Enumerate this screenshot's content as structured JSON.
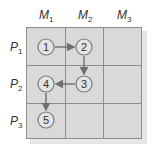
{
  "diagram": {
    "columns": [
      {
        "label": "M",
        "sub": "1"
      },
      {
        "label": "M",
        "sub": "2"
      },
      {
        "label": "M",
        "sub": "3"
      }
    ],
    "rows": [
      {
        "label": "P",
        "sub": "1"
      },
      {
        "label": "P",
        "sub": "2"
      },
      {
        "label": "P",
        "sub": "3"
      }
    ],
    "nodes": [
      {
        "id": "1",
        "row": 1,
        "col": 1
      },
      {
        "id": "2",
        "row": 1,
        "col": 2
      },
      {
        "id": "3",
        "row": 2,
        "col": 2
      },
      {
        "id": "4",
        "row": 2,
        "col": 1
      },
      {
        "id": "5",
        "row": 3,
        "col": 1
      }
    ],
    "edges": [
      {
        "from": "1",
        "to": "2"
      },
      {
        "from": "2",
        "to": "3"
      },
      {
        "from": "3",
        "to": "4"
      },
      {
        "from": "4",
        "to": "5"
      }
    ],
    "colors": {
      "cell_fill": "#d9d9d9",
      "grid_line": "#8c8c8c",
      "node_fill": "#e4e4e4",
      "node_stroke": "#7a7a7a",
      "arrow": "#6e6e6e"
    }
  }
}
